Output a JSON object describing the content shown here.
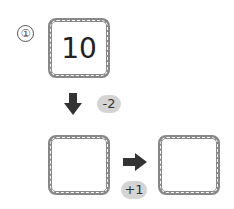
{
  "problem": {
    "number_label": "①",
    "start_value": "10",
    "step1": {
      "direction": "down",
      "operation": "-2",
      "result": ""
    },
    "step2": {
      "direction": "right",
      "operation": "+1",
      "result": ""
    }
  }
}
